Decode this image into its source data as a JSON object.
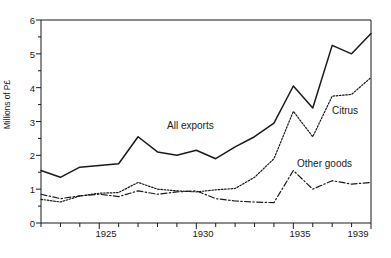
{
  "chart_data": {
    "type": "line",
    "title": "",
    "subtitle": "",
    "xlabel": "",
    "ylabel": "Millions of P£",
    "xlim": [
      1922,
      1939
    ],
    "ylim": [
      0,
      6
    ],
    "grid": false,
    "legend_position": "inline-annotations",
    "x": [
      1922,
      1923,
      1924,
      1925,
      1926,
      1927,
      1928,
      1929,
      1930,
      1931,
      1932,
      1933,
      1934,
      1935,
      1936,
      1937,
      1938,
      1939
    ],
    "x_tick_labels": [
      "1925",
      "1930",
      "1935",
      "1939"
    ],
    "x_tick_values": [
      1925,
      1930,
      1935,
      1939
    ],
    "y_tick_labels": [
      "0",
      "1",
      "2",
      "3",
      "4",
      "5",
      "6"
    ],
    "y_tick_values": [
      0,
      1,
      2,
      3,
      4,
      5,
      6
    ],
    "y_minor_ticks": [
      0.5,
      1.5,
      2.5,
      3.5,
      4.5,
      5.5
    ],
    "series": [
      {
        "name": "All exports",
        "style": "solid",
        "label_text": "All exports",
        "values": [
          1.55,
          1.35,
          1.65,
          1.7,
          1.75,
          2.55,
          2.1,
          2.0,
          2.15,
          1.9,
          2.25,
          2.55,
          2.95,
          4.05,
          3.4,
          5.25,
          5.0,
          5.6
        ]
      },
      {
        "name": "Citrus",
        "style": "dotted",
        "label_text": "Citrus",
        "values": [
          0.7,
          0.62,
          0.8,
          0.88,
          0.9,
          1.2,
          1.0,
          0.95,
          0.92,
          0.98,
          1.02,
          1.35,
          1.9,
          3.3,
          2.55,
          3.75,
          3.8,
          4.3
        ]
      },
      {
        "name": "Other goods",
        "style": "dash-dot",
        "label_text": "Other goods",
        "values": [
          0.85,
          0.72,
          0.8,
          0.85,
          0.78,
          0.95,
          0.85,
          0.92,
          0.95,
          0.72,
          0.65,
          0.62,
          0.6,
          1.55,
          1.0,
          1.25,
          1.15,
          1.2
        ]
      }
    ]
  },
  "axis": {
    "y_title": "Millions of P£"
  },
  "annotations": {
    "all_exports": "All exports",
    "citrus": "Citrus",
    "other_goods": "Other goods"
  }
}
